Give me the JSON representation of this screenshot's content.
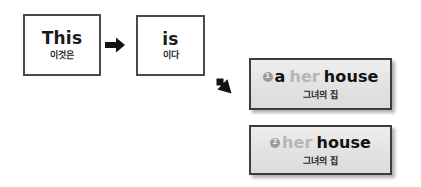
{
  "sequence": {
    "boxes": [
      {
        "english": "This",
        "korean": "이것은"
      },
      {
        "english": "is",
        "korean": "이다"
      }
    ],
    "arrows": [
      {
        "icon": "arrow-right-icon",
        "direction": "right"
      },
      {
        "icon": "arrow-down-right-icon",
        "direction": "down-right"
      }
    ]
  },
  "panels": [
    {
      "number": "1",
      "tokens": [
        {
          "text": "a",
          "emphasis": "strong"
        },
        {
          "text": "her",
          "emphasis": "faded"
        },
        {
          "text": "house",
          "emphasis": "strong"
        }
      ],
      "korean": "그녀의 집"
    },
    {
      "number": "2",
      "tokens": [
        {
          "text": "her",
          "emphasis": "faded"
        },
        {
          "text": "house",
          "emphasis": "strong"
        }
      ],
      "korean": "그녀의 집"
    }
  ],
  "colors": {
    "box_border": "#4a4a4a",
    "panel_border": "#3d3d3d",
    "panel_fill": "#e6e6e6",
    "badge_fill": "#9b9b9b",
    "text_strong": "#121212",
    "text_faded": "#b6b6b6"
  }
}
